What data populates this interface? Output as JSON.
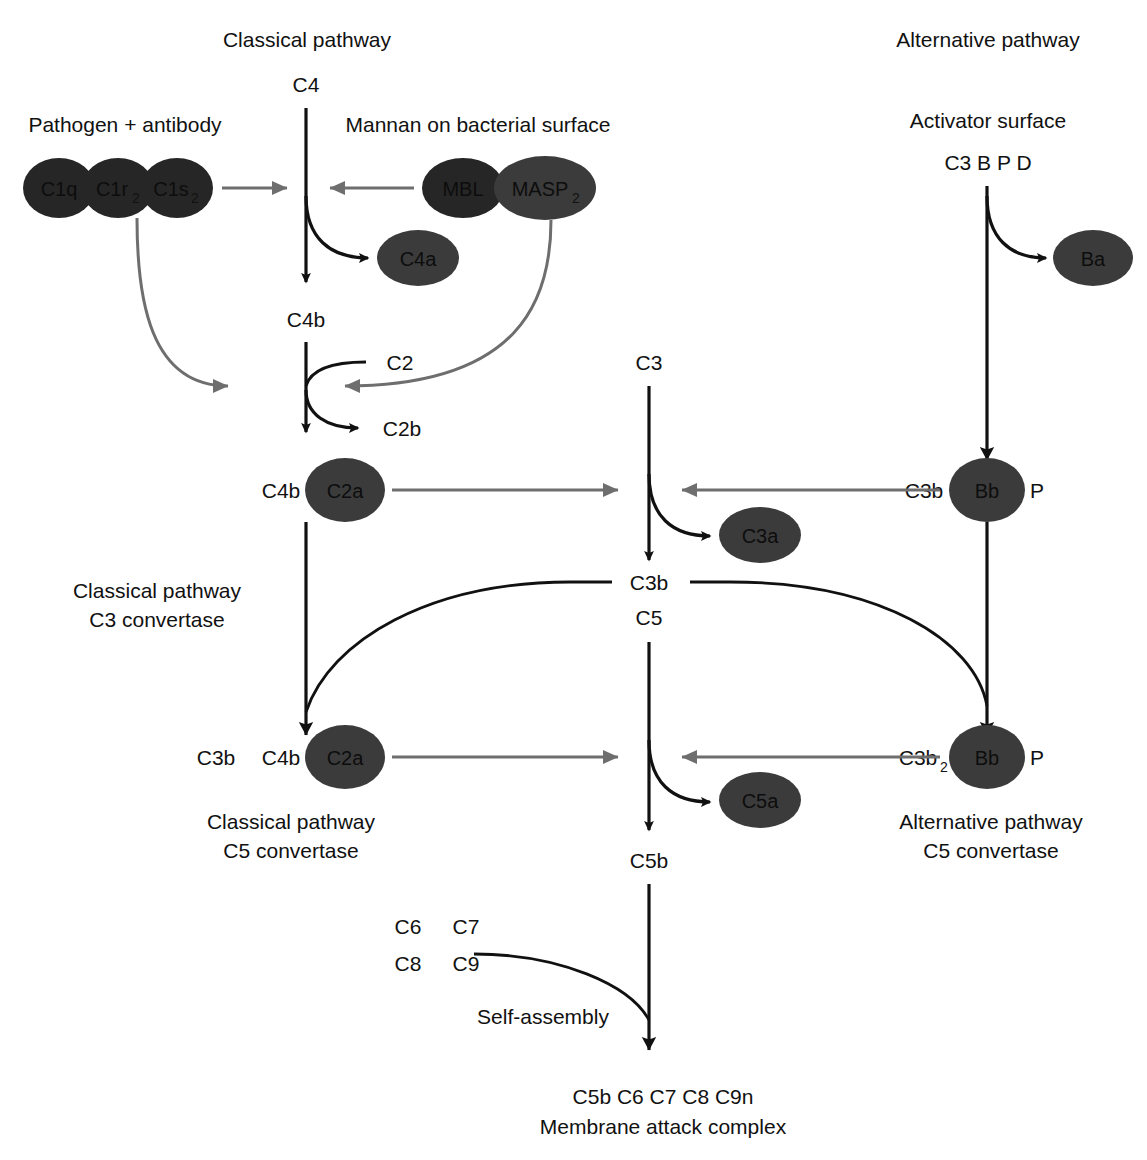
{
  "figure": {
    "type": "pathway-diagram",
    "background_color": "#ffffff",
    "blob_color": "#3b3b3b",
    "line_color": "#111111",
    "gray_arrow_color": "#6e6e6e"
  },
  "headings": {
    "classical": "Classical pathway",
    "alternative": "Alternative pathway"
  },
  "triggers": {
    "pathogen_antibody": "Pathogen + antibody",
    "mannan": "Mannan on bacterial surface",
    "activator_surface": "Activator surface",
    "activator_components": "C3 B P D"
  },
  "c1_complex": [
    {
      "label": "C1q",
      "sub": ""
    },
    {
      "label": "C1r",
      "sub": "2"
    },
    {
      "label": "C1s",
      "sub": "2"
    }
  ],
  "mbl_complex": [
    {
      "label": "MBL",
      "sub": ""
    },
    {
      "label": "MASP",
      "sub": "2"
    }
  ],
  "classical_branch": {
    "substrate_c4": "C4",
    "fragment_c4a": "C4a",
    "product_c4b": "C4b",
    "substrate_c2": "C2",
    "fragment_c2b": "C2b",
    "c3_convertase": {
      "part_a": "C4b",
      "part_b": "C2a",
      "label_line1": "Classical pathway",
      "label_line2": "C3 convertase"
    },
    "c5_convertase": {
      "part_a": "C3b",
      "part_b": "C4b",
      "part_c": "C2a",
      "label_line1": "Classical pathway",
      "label_line2": "C5 convertase"
    }
  },
  "alternative_branch": {
    "fragment_ba": "Ba",
    "c3_convertase": {
      "part_a": "C3b",
      "part_a_sub": "",
      "part_b": "Bb",
      "part_c": "P"
    },
    "c5_convertase": {
      "part_a": "C3b",
      "part_a_sub": "2",
      "part_b": "Bb",
      "part_c": "P",
      "label_line1": "Alternative pathway",
      "label_line2": "C5 convertase"
    }
  },
  "central_branch": {
    "substrate_c3": "C3",
    "fragment_c3a": "C3a",
    "product_c3b": "C3b",
    "substrate_c5": "C5",
    "fragment_c5a": "C5a",
    "product_c5b": "C5b"
  },
  "mac": {
    "components": [
      [
        "C6",
        "C7"
      ],
      [
        "C8",
        "C9"
      ]
    ],
    "process_label": "Self-assembly",
    "result_line1": "C5b C6 C7 C8 C9n",
    "result_line2": "Membrane attack complex"
  }
}
